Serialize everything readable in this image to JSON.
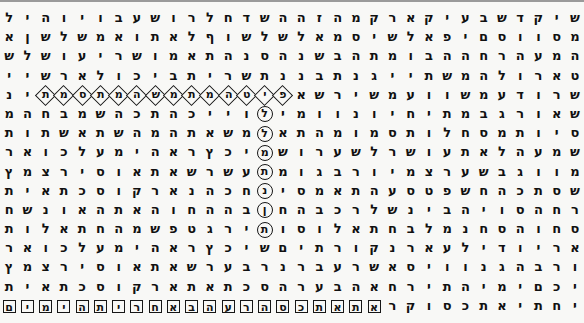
{
  "panel": {
    "title": "Hebrew Letter Matrix",
    "kind": "letter-grid",
    "rows": 16,
    "cols": 32,
    "text_direction": "rtl",
    "background_color": "#f8f8f6",
    "letter_color": "#111111",
    "marker_color": "#161616"
  },
  "markers": {
    "box_label": "square-box",
    "circle_label": "circle",
    "diamond_label": "diamond",
    "both_label": "diamond-and-circle-intersection"
  },
  "highlights": {
    "horizontal_row_index": 4,
    "horizontal_letters": "פיטמהתמתמשהמיתו",
    "vertical_col_index": 14,
    "vertical_letters": "סלהמתבוש",
    "bottom_row_index": 15,
    "bottom_letters": "קראתאתכסהרעבהאחריתהימים",
    "intersection_row": 4,
    "intersection_col": 14
  },
  "grid": {
    "rows": [
      {
        "index": 0,
        "letters": [
          "ל",
          "י",
          "ה",
          "ו",
          "י",
          "ו",
          "ב",
          "ע",
          "ש",
          "ו",
          "ר",
          "ל",
          "ח",
          "ד",
          "ש",
          "ה",
          "ה",
          "ז",
          "ה",
          "מ",
          "ק",
          "ר",
          "א",
          "ק",
          "י",
          "ע",
          "ב",
          "ש",
          "ד",
          "ק",
          "י",
          "ש"
        ],
        "marks": [
          "",
          "",
          "",
          "",
          "",
          "",
          "",
          "",
          "",
          "",
          "",
          "",
          "",
          "",
          "",
          "",
          "",
          "",
          "",
          "",
          "",
          "",
          "",
          "",
          "",
          "",
          "",
          "",
          "",
          "",
          "",
          ""
        ]
      },
      {
        "index": 1,
        "letters": [
          "א",
          "ן",
          "ש",
          "ל",
          "ש",
          "מ",
          "א",
          "ו",
          "ת",
          "א",
          "ל",
          "ף",
          "ו",
          "ש",
          "ל",
          "ש",
          "ל",
          "א",
          "מ",
          "ס",
          "י",
          "ש",
          "ל",
          "א",
          "פ",
          "י",
          "ם",
          "ס",
          "ו",
          "ו",
          "ס",
          "מ"
        ],
        "marks": [
          "",
          "",
          "",
          "",
          "",
          "",
          "",
          "",
          "",
          "",
          "",
          "",
          "",
          "",
          "",
          "",
          "",
          "",
          "",
          "",
          "",
          "",
          "",
          "",
          "",
          "",
          "",
          "",
          "",
          "",
          "",
          ""
        ]
      },
      {
        "index": 2,
        "letters": [
          "ש",
          "ל",
          "ש",
          "ו",
          "ע",
          "י",
          "ר",
          "ש",
          "ו",
          "מ",
          "א",
          "ת",
          "ה",
          "נ",
          "ס",
          "ה",
          "נ",
          "ש",
          "ב",
          "ה",
          "ת",
          "מ",
          "ו",
          "ב",
          "ה",
          "ה",
          "ח",
          "ר",
          "ה",
          "ע",
          "מ",
          "ה"
        ],
        "marks": [
          "",
          "",
          "",
          "",
          "",
          "",
          "",
          "",
          "",
          "",
          "",
          "",
          "",
          "",
          "",
          "",
          "",
          "",
          "",
          "",
          "",
          "",
          "",
          "",
          "",
          "",
          "",
          "",
          "",
          "",
          "",
          ""
        ]
      },
      {
        "index": 3,
        "letters": [
          "י",
          "י",
          "ש",
          "ר",
          "א",
          "ל",
          "ו",
          "כ",
          "י",
          "ב",
          "ת",
          "י",
          "ר",
          "ש",
          "ת",
          "נ",
          "נ",
          "ב",
          "ת",
          "נ",
          "ג",
          "י",
          "י",
          "ת",
          "ש",
          "מ",
          "ה",
          "ל",
          "ו",
          "ר",
          "א",
          "ט"
        ],
        "marks": [
          "",
          "",
          "",
          "",
          "",
          "",
          "",
          "",
          "",
          "",
          "",
          "",
          "",
          "",
          "",
          "",
          "",
          "",
          "",
          "",
          "",
          "",
          "",
          "",
          "",
          "",
          "",
          "",
          "",
          "",
          "",
          ""
        ]
      },
      {
        "index": 4,
        "letters": [
          "נ",
          "י",
          "ת",
          "מ",
          "ס",
          "ת",
          "מ",
          "ה",
          "ש",
          "מ",
          "ת",
          "מ",
          "ה",
          "ט",
          "י",
          "פ",
          "א",
          "ש",
          "ר",
          "י",
          "ש",
          "מ",
          "ע",
          "ו",
          "ו",
          "ש",
          "מ",
          "ע",
          "ד",
          "ו",
          "ר",
          "ש"
        ],
        "marks": [
          "",
          "",
          "D",
          "D",
          "D",
          "D",
          "D",
          "D",
          "D",
          "D",
          "D",
          "D",
          "D",
          "B",
          "D",
          "D",
          "",
          "",
          "",
          "",
          "",
          "",
          "",
          "",
          "",
          "",
          "",
          "",
          "",
          "",
          "",
          ""
        ]
      },
      {
        "index": 5,
        "letters": [
          "מ",
          "ה",
          "ח",
          "ב",
          "מ",
          "ש",
          "ה",
          "כ",
          "ת",
          "ה",
          "כ",
          "י",
          "י",
          "ו",
          "ל",
          "י",
          "מ",
          "ו",
          "ו",
          "נ",
          "ו",
          "י",
          "ח",
          "י",
          "ת",
          "מ",
          "ב",
          "ג",
          "ר",
          "ו",
          "א",
          "ש"
        ],
        "marks": [
          "",
          "",
          "",
          "",
          "",
          "",
          "",
          "",
          "",
          "",
          "",
          "",
          "",
          "",
          "C",
          "",
          "",
          "",
          "",
          "",
          "",
          "",
          "",
          "",
          "",
          "",
          "",
          "",
          "",
          "",
          "",
          ""
        ]
      },
      {
        "index": 6,
        "letters": [
          "ת",
          "ו",
          "ת",
          "ש",
          "א",
          "ת",
          "ש",
          "ה",
          "מ",
          "ה",
          "ת",
          "א",
          "ש",
          "מ",
          "ל",
          "א",
          "ת",
          "ה",
          "מ",
          "ו",
          "מ",
          "ס",
          "ת",
          "ו",
          "ל",
          "ח",
          "ס",
          "מ",
          "ת",
          "ו",
          "י",
          "ס"
        ],
        "marks": [
          "",
          "",
          "",
          "",
          "",
          "",
          "",
          "",
          "",
          "",
          "",
          "",
          "",
          "",
          "C",
          "",
          "",
          "",
          "",
          "",
          "",
          "",
          "",
          "",
          "",
          "",
          "",
          "",
          "",
          "",
          "",
          ""
        ]
      },
      {
        "index": 7,
        "letters": [
          "ר",
          "א",
          "ו",
          "כ",
          "ל",
          "ע",
          "מ",
          "י",
          "ה",
          "א",
          "ר",
          "ץ",
          "כ",
          "י",
          "מ",
          "ש",
          "ו",
          "ר",
          "ע",
          "ש",
          "ל",
          "ר",
          "ש",
          "ו",
          "ע",
          "ת",
          "א",
          "ל",
          "ה",
          "ע",
          "מ",
          "ש"
        ],
        "marks": [
          "",
          "",
          "",
          "",
          "",
          "",
          "",
          "",
          "",
          "",
          "",
          "",
          "",
          "",
          "C",
          "",
          "",
          "",
          "",
          "",
          "",
          "",
          "",
          "",
          "",
          "",
          "",
          "",
          "",
          "",
          "",
          ""
        ]
      },
      {
        "index": 8,
        "letters": [
          "ץ",
          "מ",
          "צ",
          "ר",
          "י",
          "ס",
          "ו",
          "א",
          "ת",
          "א",
          "ש",
          "ר",
          "ש",
          "ע",
          "ת",
          "מ",
          "ו",
          "ג",
          "ב",
          "ר",
          "ו",
          "י",
          "מ",
          "צ",
          "ר",
          "ע",
          "ש",
          "ב",
          "ג",
          "ו",
          "ו",
          "מ"
        ],
        "marks": [
          "",
          "",
          "",
          "",
          "",
          "",
          "",
          "",
          "",
          "",
          "",
          "",
          "",
          "",
          "C",
          "",
          "",
          "",
          "",
          "",
          "",
          "",
          "",
          "",
          "",
          "",
          "",
          "",
          "",
          "",
          "",
          ""
        ]
      },
      {
        "index": 9,
        "letters": [
          "ת",
          "י",
          "א",
          "ת",
          "כ",
          "ס",
          "ו",
          "ק",
          "ר",
          "א",
          "נ",
          "ה",
          "כ",
          "ח",
          "נ",
          "י",
          "ס",
          "מ",
          "א",
          "ת",
          "ה",
          "ע",
          "ס",
          "ט",
          "פ",
          "ש",
          "ח",
          "ה",
          "כ",
          "ת",
          "ס",
          "ש"
        ],
        "marks": [
          "",
          "",
          "",
          "",
          "",
          "",
          "",
          "",
          "",
          "",
          "",
          "",
          "",
          "",
          "C",
          "",
          "",
          "",
          "",
          "",
          "",
          "",
          "",
          "",
          "",
          "",
          "",
          "",
          "",
          "",
          "",
          ""
        ]
      },
      {
        "index": 10,
        "letters": [
          "ח",
          "ש",
          "נ",
          "ו",
          "א",
          "ה",
          "ת",
          "א",
          "ה",
          "ו",
          "ח",
          "ה",
          "ה",
          "ב",
          "ן",
          "ח",
          "ה",
          "ב",
          "כ",
          "ר",
          "ל",
          "ש",
          "נ",
          "י",
          "ב",
          "ה",
          "י",
          "ו",
          "ס",
          "ה",
          "ח",
          "ר"
        ],
        "marks": [
          "",
          "",
          "",
          "",
          "",
          "",
          "",
          "",
          "",
          "",
          "",
          "",
          "",
          "",
          "C",
          "",
          "",
          "",
          "",
          "",
          "",
          "",
          "",
          "",
          "",
          "",
          "",
          "",
          "",
          "",
          "",
          ""
        ]
      },
      {
        "index": 11,
        "letters": [
          "ת",
          "ו",
          "ל",
          "א",
          "ת",
          "ח",
          "ה",
          "מ",
          "ש",
          "פ",
          "ט",
          "ג",
          "ר",
          "י",
          "ת",
          "ו",
          "ס",
          "ו",
          "ל",
          "א",
          "ת",
          "ח",
          "ב",
          "ל",
          "מ",
          "נ",
          "ח",
          "ס",
          "ה",
          "ו",
          "ח",
          "ס"
        ],
        "marks": [
          "",
          "",
          "",
          "",
          "",
          "",
          "",
          "",
          "",
          "",
          "",
          "",
          "",
          "",
          "C",
          "",
          "",
          "",
          "",
          "",
          "",
          "",
          "",
          "",
          "",
          "",
          "",
          "",
          "",
          "",
          "",
          ""
        ]
      },
      {
        "index": 12,
        "letters": [
          "ר",
          "א",
          "ו",
          "כ",
          "ל",
          "ע",
          "מ",
          "י",
          "ה",
          "א",
          "ר",
          "ץ",
          "כ",
          "י",
          "ש",
          "ם",
          "י",
          "ת",
          "ר",
          "ו",
          "ק",
          "נ",
          "ר",
          "א",
          "ע",
          "ל",
          "י",
          "ד",
          "ו",
          "י",
          "ר",
          "א"
        ],
        "marks": [
          "",
          "",
          "",
          "",
          "",
          "",
          "",
          "",
          "",
          "",
          "",
          "",
          "",
          "",
          "",
          "",
          "",
          "",
          "",
          "",
          "",
          "",
          "",
          "",
          "",
          "",
          "",
          "",
          "",
          "",
          "",
          ""
        ]
      },
      {
        "index": 13,
        "letters": [
          "ץ",
          "מ",
          "צ",
          "ר",
          "י",
          "ס",
          "ו",
          "א",
          "ת",
          "א",
          "ש",
          "ר",
          "ע",
          "ב",
          "ר",
          "נ",
          "ר",
          "ב",
          "ע",
          "ר",
          "ש",
          "א",
          "ס",
          "י",
          "ו",
          "ו",
          "נ",
          "ג",
          "ה",
          "ב",
          "ר",
          "ו"
        ],
        "marks": [
          "",
          "",
          "",
          "",
          "",
          "",
          "",
          "",
          "",
          "",
          "",
          "",
          "",
          "",
          "",
          "",
          "",
          "",
          "",
          "",
          "",
          "",
          "",
          "",
          "",
          "",
          "",
          "",
          "",
          "",
          "",
          ""
        ]
      },
      {
        "index": 14,
        "letters": [
          "ת",
          "י",
          "א",
          "ת",
          "כ",
          "ס",
          "ו",
          "ק",
          "ר",
          "א",
          "ת",
          "א",
          "ת",
          "כ",
          "ס",
          "ה",
          "ר",
          "ע",
          "ב",
          "ה",
          "א",
          "ח",
          "ר",
          "י",
          "ת",
          "ה",
          "י",
          "מ",
          "י",
          "ם",
          "כ",
          "י"
        ],
        "marks": [
          "",
          "",
          "",
          "",
          "",
          "",
          "",
          "",
          "",
          "",
          "",
          "",
          "",
          "",
          "",
          "",
          "",
          "",
          "",
          "",
          "",
          "",
          "",
          "",
          "",
          "",
          "",
          "",
          "",
          "",
          "",
          ""
        ]
      },
      {
        "index": 15,
        "letters": [
          "ם",
          "י",
          "מ",
          "י",
          "ה",
          "ת",
          "י",
          "ר",
          "ח",
          "א",
          "ב",
          "ה",
          "ע",
          "ר",
          "ה",
          "ס",
          "כ",
          "ת",
          "א",
          "ת",
          "א",
          "ר",
          "ק",
          "ו",
          "ס",
          "כ",
          "ת",
          "א",
          "י",
          "ת",
          "ח",
          "י"
        ],
        "marks": [
          "X",
          "X",
          "X",
          "X",
          "X",
          "X",
          "X",
          "X",
          "X",
          "X",
          "X",
          "X",
          "X",
          "X",
          "X",
          "X",
          "X",
          "X",
          "X",
          "X",
          "X",
          "",
          "",
          "",
          "",
          "",
          "",
          "",
          "",
          "",
          "",
          ""
        ]
      }
    ]
  }
}
